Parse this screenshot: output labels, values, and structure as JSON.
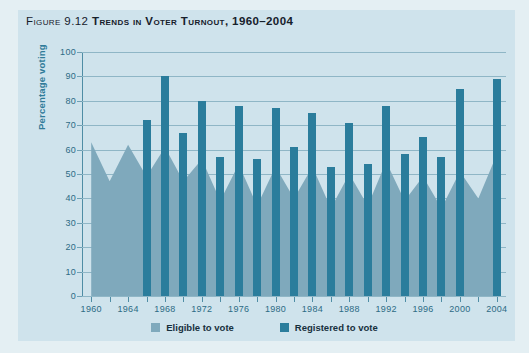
{
  "figure": {
    "number_label": "Figure 9.12",
    "title": "Trends in Voter Turnout, 1960–2004",
    "full_title": "Figure 9.12 Trends in Voter Turnout, 1960–2004"
  },
  "colors": {
    "page_background": "#e4eff3",
    "plot_background": "#cfe3ec",
    "eligible_fill": "#7fa9bc",
    "registered_fill": "#2b7d9c",
    "gridline": "#8fb6c6",
    "axis": "#4f8da5",
    "tick_text": "#2d6b85",
    "axis_title_text": "#2f7b99",
    "title_text": "#16202b"
  },
  "legend": {
    "position": "bottom-center",
    "items": [
      {
        "label": "Eligible to vote",
        "swatch_color": "#7fa9bc",
        "name": "eligible"
      },
      {
        "label": "Registered to vote",
        "swatch_color": "#2b7d9c",
        "name": "registered"
      }
    ]
  },
  "chart_data": {
    "type": "bar",
    "title": "Trends in Voter Turnout, 1960–2004",
    "xlabel": "",
    "ylabel": "Percentage voting",
    "ylim": [
      0,
      100
    ],
    "ytick_values": [
      0,
      10,
      20,
      30,
      40,
      50,
      60,
      70,
      80,
      90,
      100
    ],
    "ytick_labels": [
      "0",
      "10",
      "20",
      "30",
      "40",
      "50",
      "60",
      "70",
      "80",
      "90",
      "100"
    ],
    "grid": true,
    "grid_axis": "y",
    "xlim": [
      1959,
      2005
    ],
    "x": [
      1960,
      1962,
      1964,
      1966,
      1968,
      1970,
      1972,
      1974,
      1976,
      1978,
      1980,
      1982,
      1984,
      1986,
      1988,
      1990,
      1992,
      1994,
      1996,
      1998,
      2000,
      2002,
      2004
    ],
    "xtick_values": [
      1960,
      1962,
      1964,
      1966,
      1968,
      1970,
      1972,
      1974,
      1976,
      1978,
      1980,
      1982,
      1984,
      1986,
      1988,
      1990,
      1992,
      1994,
      1996,
      1998,
      2000,
      2002,
      2004
    ],
    "xtick_labels_shown": [
      "1960",
      "1964",
      "1968",
      "1972",
      "1976",
      "1980",
      "1984",
      "1988",
      "1992",
      "1996",
      "2000",
      "2004"
    ],
    "xtick_labeled_years": [
      1960,
      1964,
      1968,
      1972,
      1976,
      1980,
      1984,
      1988,
      1992,
      1996,
      2000,
      2004
    ],
    "series": [
      {
        "name": "Eligible to vote",
        "chart_type": "area",
        "color": "#7fa9bc",
        "starts_at_year": 1960,
        "values": [
          63,
          47,
          62,
          49,
          61,
          47,
          56,
          39,
          54,
          37,
          53,
          40,
          53,
          36,
          50,
          37,
          55,
          39,
          49,
          36,
          51,
          40,
          58
        ]
      },
      {
        "name": "Registered to vote",
        "chart_type": "bar",
        "color": "#2b7d9c",
        "starts_at_year": 1966,
        "values": [
          null,
          null,
          null,
          72,
          90,
          67,
          80,
          57,
          78,
          56,
          77,
          61,
          75,
          53,
          71,
          54,
          78,
          58,
          65,
          57,
          85,
          null,
          89
        ]
      }
    ]
  }
}
